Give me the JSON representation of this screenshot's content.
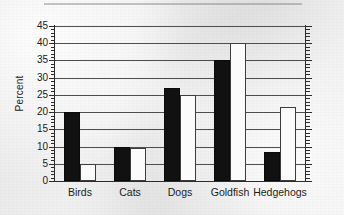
{
  "chart_data": {
    "type": "bar",
    "title": "",
    "xlabel": "",
    "ylabel": "Percent",
    "ylim": [
      0,
      45
    ],
    "ytick_step": 5,
    "yminor_step": 1,
    "grid": true,
    "legend": "none",
    "categories": [
      "Birds",
      "Cats",
      "Dogs",
      "Goldfish",
      "Hedgehogs"
    ],
    "ytick_labels": [
      "0",
      "5",
      "10",
      "15",
      "20",
      "25",
      "30",
      "35",
      "40",
      "45"
    ],
    "series": [
      {
        "name": "filled",
        "style": "solid-black",
        "color": "#111111",
        "values": [
          20,
          10,
          27,
          35,
          8.5
        ]
      },
      {
        "name": "open",
        "style": "white-outline",
        "color": "#fbfbfb",
        "values": [
          5,
          9.5,
          25,
          40,
          21.5
        ]
      }
    ]
  },
  "axes": {
    "y_label": "Percent"
  }
}
